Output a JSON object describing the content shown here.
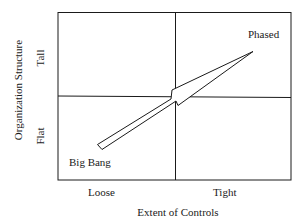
{
  "diagram": {
    "type": "2x2-matrix",
    "x_axis": {
      "title": "Extent of Controls",
      "low_label": "Loose",
      "high_label": "Tight"
    },
    "y_axis": {
      "title": "Organization Structure",
      "low_label": "Flat",
      "high_label": "Tall"
    },
    "arrow": {
      "from_label": "Big Bang",
      "to_label": "Phased",
      "direction": "from lower-left (Loose/Flat) to upper-right (Tight/Tall)"
    },
    "colors": {
      "line": "#1a1a1a",
      "background": "#ffffff"
    }
  }
}
